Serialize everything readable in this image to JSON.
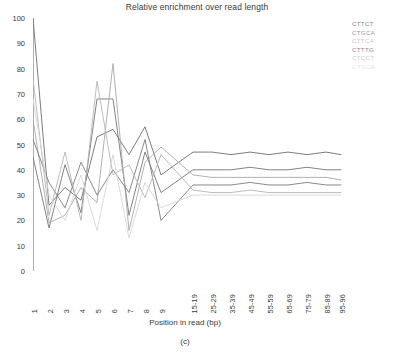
{
  "chart_data": {
    "type": "line",
    "title": "Relative enrichment over read length",
    "xlabel": "Position in read (bp)",
    "ylabel": "",
    "ylim": [
      0,
      100
    ],
    "yticks": [
      0,
      10,
      20,
      30,
      40,
      50,
      60,
      70,
      80,
      90,
      100
    ],
    "grid": false,
    "legend_position": "right",
    "categories": [
      "1",
      "2",
      "3",
      "4",
      "5",
      "6",
      "7",
      "8",
      "9",
      "15-19",
      "25-29",
      "35-39",
      "45-49",
      "55-59",
      "65-69",
      "75-79",
      "85-89",
      "95-96"
    ],
    "x_positions_px": [
      0,
      16,
      32,
      48,
      64,
      80,
      96,
      112,
      128,
      160,
      179,
      198,
      217,
      236,
      255,
      274,
      293,
      308
    ],
    "series": [
      {
        "name": "CTTCT",
        "color": "#6e6e6e",
        "values": [
          100,
          26,
          33,
          28,
          53,
          56,
          46,
          57,
          38,
          47,
          47,
          46,
          47,
          46,
          47,
          46,
          47,
          46
        ]
      },
      {
        "name": "CTGCA",
        "color": "#767676",
        "values": [
          45,
          17,
          42,
          23,
          68,
          68,
          22,
          47,
          31,
          40,
          40,
          40,
          41,
          40,
          40,
          41,
          40,
          40
        ]
      },
      {
        "name": "CTTCA",
        "color": "#a8a8a8",
        "values": [
          60,
          19,
          22,
          33,
          27,
          82,
          16,
          43,
          49,
          38,
          37,
          37,
          37,
          37,
          37,
          37,
          37,
          36
        ]
      },
      {
        "name": "CTTTG",
        "color": "#7d7d7d",
        "values": [
          52,
          35,
          25,
          43,
          30,
          40,
          31,
          52,
          20,
          34,
          34,
          34,
          35,
          34,
          34,
          35,
          34,
          34
        ]
      },
      {
        "name": "CTCCT",
        "color": "#b5b5b5",
        "values": [
          76,
          22,
          47,
          20,
          75,
          38,
          42,
          29,
          46,
          32,
          31,
          31,
          32,
          31,
          31,
          31,
          31,
          31
        ]
      },
      {
        "name": "CTGCA",
        "color": "#d6d6d6",
        "values": [
          68,
          30,
          20,
          38,
          16,
          46,
          13,
          35,
          25,
          30,
          30,
          30,
          30,
          30,
          30,
          30,
          30,
          30
        ]
      }
    ],
    "caption": "(c)"
  },
  "legend": {
    "entries": [
      {
        "label": "CTTCT",
        "color": "#8a8a8a"
      },
      {
        "label": "CTGCA",
        "color": "#9a9a9a"
      },
      {
        "label": "CTTCA",
        "color": "#c8c8c8"
      },
      {
        "label": "CTTTG",
        "color": "#8f8f8f"
      },
      {
        "label": "CTCCT",
        "color": "#cfcfcf"
      },
      {
        "label": "CTGCA",
        "color": "#e4e4e4"
      }
    ]
  },
  "axes": {
    "axis_color": "#b0b0b0"
  }
}
